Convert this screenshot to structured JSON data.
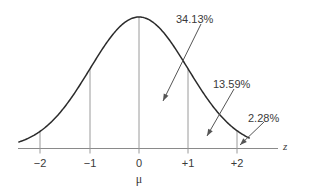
{
  "figure": {
    "type": "normal-distribution-curve",
    "background_color": "#ffffff",
    "curve_color": "#2b2b2b",
    "axis_color": "#8a8a8a",
    "label_color": "#3a3a3a"
  },
  "axis": {
    "name": "z",
    "mean_symbol": "μ",
    "ticks": [
      {
        "label": "−2",
        "z": -2,
        "x": 40
      },
      {
        "label": "−1",
        "z": -1,
        "x": 90
      },
      {
        "label": "0",
        "z": 0,
        "x": 139
      },
      {
        "label": "+1",
        "z": 1,
        "x": 188
      },
      {
        "label": "+2",
        "z": 2,
        "x": 237
      }
    ]
  },
  "annotations": [
    {
      "id": "region-0-to-1",
      "label": "34.13%",
      "text_x": 176,
      "text_y": 14,
      "arrow_from_x": 201,
      "arrow_from_y": 24,
      "arrow_to_x": 163,
      "arrow_to_y": 101
    },
    {
      "id": "region-1-to-2",
      "label": "13.59%",
      "text_x": 213,
      "text_y": 79,
      "arrow_from_x": 234,
      "arrow_from_y": 89,
      "arrow_to_x": 207,
      "arrow_to_y": 136
    },
    {
      "id": "region-beyond-2",
      "label": "2.28%",
      "text_x": 248,
      "text_y": 113,
      "arrow_from_x": 264,
      "arrow_from_y": 122,
      "arrow_to_x": 240,
      "arrow_to_y": 145
    }
  ],
  "chart_data": {
    "type": "line",
    "title": "",
    "subtitle": "",
    "xlabel": "z",
    "ylabel": "",
    "grid": false,
    "legend": "none",
    "xlim": [
      -2.45,
      2.25
    ],
    "ylim": [
      0,
      1
    ],
    "x_tick_labels": [
      "−2",
      "−1",
      "0",
      "+1",
      "+2"
    ],
    "x_tick_values": [
      -2,
      -1,
      0,
      1,
      2
    ],
    "curve": {
      "name": "standard normal density",
      "function": "exp(-z^2/2)",
      "x": [
        -2.45,
        -2.2,
        -2.0,
        -1.75,
        -1.5,
        -1.25,
        -1.0,
        -0.75,
        -0.5,
        -0.25,
        0,
        0.25,
        0.5,
        0.75,
        1.0,
        1.25,
        1.5,
        1.75,
        2.0,
        2.2
      ],
      "y": [
        0.0497,
        0.0889,
        0.1353,
        0.2163,
        0.3247,
        0.4578,
        0.6065,
        0.7548,
        0.8825,
        0.9692,
        1.0,
        0.9692,
        0.8825,
        0.7548,
        0.6065,
        0.4578,
        0.3247,
        0.2163,
        0.1353,
        0.0889
      ]
    },
    "ordinates_at": [
      -2,
      -1,
      0,
      1,
      2
    ],
    "area_labels": [
      {
        "interval": "0 to +1",
        "value": "34.13%",
        "percent": 34.13
      },
      {
        "interval": "+1 to +2",
        "value": "13.59%",
        "percent": 13.59
      },
      {
        "interval": "beyond +2",
        "value": "2.28%",
        "percent": 2.28
      }
    ]
  }
}
